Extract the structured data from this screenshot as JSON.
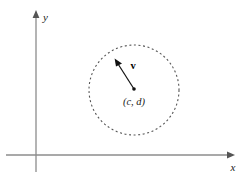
{
  "figure": {
    "background_color": "#ffffff",
    "width": 247,
    "height": 176
  },
  "axes": {
    "x_axis": {
      "label": "x",
      "color": "#8c8c8c",
      "origin_x": 36,
      "y": 155,
      "tip_x": 234,
      "label_x": 233,
      "label_y": 170
    },
    "y_axis": {
      "label": "y",
      "color": "#8c8c8c",
      "x": 36,
      "bottom_y": 172,
      "tip_y": 11,
      "label_x": 43,
      "label_y": 20
    }
  },
  "circle": {
    "name": "dashed-circle",
    "center_x": 134,
    "center_y": 90,
    "radius": 45,
    "color": "#555555",
    "style": "dashed",
    "dash_pattern": "2 2.6",
    "stroke_width": 1.1
  },
  "center_point": {
    "label": "(c, d)",
    "x": 134,
    "y": 89,
    "dot_radius": 1.8,
    "color": "#111111",
    "label_x": 134,
    "label_y": 104
  },
  "vector": {
    "label": "v",
    "color": "#111111",
    "tail_x": 134,
    "tail_y": 89,
    "tip_x": 115,
    "tip_y": 59,
    "stroke_width": 1.2,
    "label_x": 133,
    "label_y": 68
  }
}
